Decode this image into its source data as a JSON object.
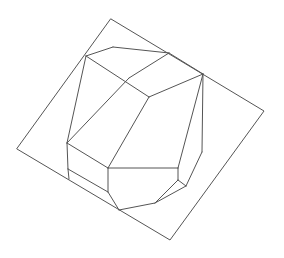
{
  "figure": {
    "stroke_color": "#555555",
    "stroke_width": 1,
    "background": "#ffffff"
  },
  "plane": {
    "name": "square-plane",
    "points": [
      [
        111,
        19
      ],
      [
        264,
        111
      ],
      [
        170,
        240
      ],
      [
        17,
        149
      ]
    ]
  },
  "edges": [
    {
      "name": "top-face-left-edge",
      "from": [
        86,
        56
      ],
      "to": [
        113,
        47
      ]
    },
    {
      "name": "top-face-top-edge",
      "from": [
        113,
        47
      ],
      "to": [
        169,
        53
      ]
    },
    {
      "name": "top-face-right-edge",
      "from": [
        169,
        53
      ],
      "to": [
        203,
        74
      ]
    },
    {
      "name": "top-face-ridge-left",
      "from": [
        86,
        56
      ],
      "to": [
        149,
        97
      ]
    },
    {
      "name": "top-face-ridge-right",
      "from": [
        149,
        97
      ],
      "to": [
        203,
        74
      ]
    },
    {
      "name": "top-face-diagonal",
      "from": [
        169,
        53
      ],
      "to": [
        129,
        78
      ]
    },
    {
      "name": "left-long-edge",
      "from": [
        86,
        56
      ],
      "to": [
        67,
        143
      ]
    },
    {
      "name": "center-long-edge",
      "from": [
        129,
        78
      ],
      "to": [
        67,
        143
      ]
    },
    {
      "name": "center-mid-edge",
      "from": [
        149,
        97
      ],
      "to": [
        108,
        168
      ]
    },
    {
      "name": "front-box-top-edge",
      "from": [
        67,
        143
      ],
      "to": [
        108,
        168
      ]
    },
    {
      "name": "front-box-left-edge",
      "from": [
        67,
        143
      ],
      "to": [
        68,
        169
      ]
    },
    {
      "name": "front-box-right-edge",
      "from": [
        108,
        168
      ],
      "to": [
        108,
        192
      ]
    },
    {
      "name": "front-box-mid-edge",
      "from": [
        68,
        169
      ],
      "to": [
        108,
        192
      ]
    },
    {
      "name": "front-box-bottom-left",
      "from": [
        68,
        169
      ],
      "to": [
        69,
        179
      ]
    },
    {
      "name": "front-box-bottom-slant",
      "from": [
        108,
        192
      ],
      "to": [
        119,
        210
      ]
    },
    {
      "name": "front-face-top-edge",
      "from": [
        108,
        168
      ],
      "to": [
        178,
        168
      ]
    },
    {
      "name": "right-inner-edge",
      "from": [
        203,
        74
      ],
      "to": [
        178,
        168
      ]
    },
    {
      "name": "right-outer-edge",
      "from": [
        203,
        74
      ],
      "to": [
        202,
        152
      ]
    },
    {
      "name": "right-outer-lower-edge",
      "from": [
        202,
        152
      ],
      "to": [
        186,
        186
      ]
    },
    {
      "name": "right-face-short-edge",
      "from": [
        178,
        168
      ],
      "to": [
        178,
        180
      ]
    },
    {
      "name": "small-facet-top",
      "from": [
        178,
        180
      ],
      "to": [
        186,
        186
      ]
    },
    {
      "name": "small-facet-left",
      "from": [
        178,
        180
      ],
      "to": [
        155,
        203
      ]
    },
    {
      "name": "small-facet-bottom",
      "from": [
        186,
        186
      ],
      "to": [
        155,
        203
      ]
    },
    {
      "name": "bottom-edge",
      "from": [
        155,
        203
      ],
      "to": [
        119,
        210
      ]
    }
  ]
}
